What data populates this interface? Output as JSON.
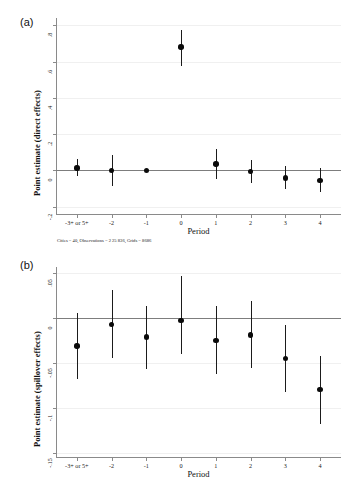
{
  "figure": {
    "panel_a_tag": "(a)",
    "panel_b_tag": "(b)",
    "footnote": "Cities = 40, Observations = 2 25 836, Grids = 8686"
  },
  "chart_data": [
    {
      "id": "panel-a",
      "type": "scatter",
      "title": "",
      "panel_label": "(a)",
      "xlabel": "Period",
      "ylabel": "Point estimate (direct effects)",
      "categories": [
        "-3+ or 5+",
        "-2",
        "-1",
        "0",
        "1",
        "2",
        "3",
        "4"
      ],
      "x": [
        0,
        1,
        2,
        3,
        4,
        5,
        6,
        7
      ],
      "values": [
        0.014,
        0.0,
        0.0,
        0.68,
        0.036,
        -0.005,
        -0.041,
        -0.054
      ],
      "ci_low": [
        -0.033,
        -0.088,
        -0.004,
        0.575,
        -0.049,
        -0.068,
        -0.105,
        -0.117
      ],
      "ci_high": [
        0.061,
        0.087,
        0.004,
        0.775,
        0.117,
        0.06,
        0.022,
        0.013
      ],
      "yticks": [
        ".8",
        ".6",
        ".4",
        ".2",
        "0",
        "-.2"
      ],
      "ytick_values": [
        0.8,
        0.6,
        0.4,
        0.2,
        0.0,
        -0.2
      ],
      "ylim": [
        -0.24,
        0.84
      ],
      "xlim": [
        -0.6,
        7.6
      ],
      "grid": true,
      "reference_line": 0,
      "legend": "none",
      "footnote": "Cities = 40, Observations = 2 25 836, Grids = 8686"
    },
    {
      "id": "panel-b",
      "type": "scatter",
      "title": "",
      "panel_label": "(b)",
      "xlabel": "Period",
      "ylabel": "Point estimate (spillover effects)",
      "categories": [
        "-3+ or 5+",
        "-2",
        "-1",
        "0",
        "1",
        "2",
        "3",
        "4"
      ],
      "x": [
        0,
        1,
        2,
        3,
        4,
        5,
        6,
        7
      ],
      "values": [
        -0.031,
        -0.007,
        -0.021,
        -0.003,
        -0.025,
        -0.019,
        -0.045,
        -0.08
      ],
      "ci_low": [
        -0.068,
        -0.044,
        -0.057,
        -0.04,
        -0.062,
        -0.056,
        -0.082,
        -0.118
      ],
      "ci_high": [
        0.006,
        0.031,
        0.013,
        0.047,
        0.013,
        0.019,
        -0.008,
        -0.042
      ],
      "yticks": [
        ".05",
        "0",
        "-.05",
        "-.1",
        "-.15"
      ],
      "ytick_values": [
        0.05,
        0.0,
        -0.05,
        -0.1,
        -0.15
      ],
      "ylim": [
        -0.155,
        0.057
      ],
      "xlim": [
        -0.6,
        7.6
      ],
      "grid": true,
      "reference_line": 0,
      "legend": "none"
    }
  ]
}
